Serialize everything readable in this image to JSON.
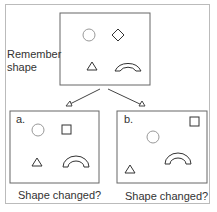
{
  "top": {
    "label": "Remember shape",
    "line1": "Remember",
    "line2": "shape"
  },
  "panels": [
    {
      "id": "a",
      "label": "a.",
      "caption": "Shape changed?"
    },
    {
      "id": "b",
      "label": "b.",
      "caption": "Shape changed?"
    }
  ],
  "colors": {
    "stroke": "#333333",
    "circle": "#999999",
    "border": "#bbbbbb"
  }
}
